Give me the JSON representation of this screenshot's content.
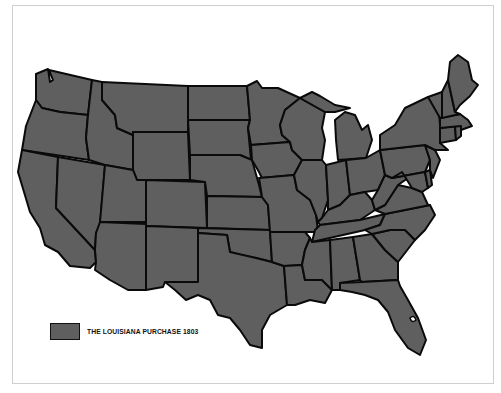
{
  "map": {
    "title": "United States",
    "fill_color": "#5f5f5f",
    "border_color": "#0a0a0a",
    "background": "#ffffff",
    "frame_border": "#cfcfcf"
  },
  "legend": {
    "swatch_color": "#5f5f5f",
    "label": "THE LOUISIANA PURCHASE 1803"
  },
  "states": [
    "WA",
    "OR",
    "CA",
    "NV",
    "ID",
    "MT",
    "WY",
    "UT",
    "AZ",
    "CO",
    "NM",
    "ND",
    "SD",
    "NE",
    "KS",
    "OK",
    "TX",
    "MN",
    "IA",
    "MO",
    "AR",
    "LA",
    "WI",
    "IL",
    "MI",
    "IN",
    "OH",
    "KY",
    "TN",
    "MS",
    "AL",
    "GA",
    "FL",
    "SC",
    "NC",
    "VA",
    "WV",
    "PA",
    "NY",
    "MD",
    "DE",
    "NJ",
    "CT",
    "RI",
    "MA",
    "VT",
    "NH",
    "ME"
  ]
}
